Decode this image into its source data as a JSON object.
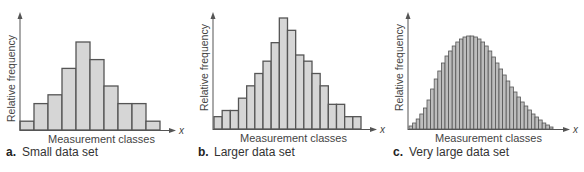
{
  "chart_data": [
    {
      "type": "bar",
      "panel": "a",
      "caption_letter": "a.",
      "caption": "Small data set",
      "xlabel": "Measurement classes",
      "ylabel": "Relative frequency",
      "x_variable": "x",
      "categories": [
        "1",
        "2",
        "3",
        "4",
        "5",
        "6",
        "7",
        "8",
        "9",
        "10"
      ],
      "values": [
        1,
        3,
        4,
        7,
        10,
        8,
        5,
        3,
        3,
        1
      ],
      "ylim": [
        0,
        10.5
      ],
      "grid": false
    },
    {
      "type": "bar",
      "panel": "b",
      "caption_letter": "b.",
      "caption": "Larger data set",
      "xlabel": "Measurement classes",
      "ylabel": "Relative frequency",
      "x_variable": "x",
      "categories": [
        "1",
        "2",
        "3",
        "4",
        "5",
        "6",
        "7",
        "8",
        "9",
        "10",
        "11",
        "12",
        "13",
        "14",
        "15",
        "16",
        "17",
        "18"
      ],
      "values": [
        1,
        1.5,
        1.5,
        2.5,
        3.5,
        4.5,
        5.5,
        7,
        9,
        8,
        6,
        5.5,
        4.5,
        3.5,
        2,
        2,
        1,
        1
      ],
      "ylim": [
        0,
        10
      ],
      "grid": false
    },
    {
      "type": "bar",
      "panel": "c",
      "caption_letter": "c.",
      "caption": "Very large data set",
      "xlabel": "Measurement classes",
      "ylabel": "Relative frequency",
      "x_variable": "x",
      "categories": [
        "1",
        "2",
        "3",
        "4",
        "5",
        "6",
        "7",
        "8",
        "9",
        "10",
        "11",
        "12",
        "13",
        "14",
        "15",
        "16",
        "17",
        "18",
        "19",
        "20",
        "21",
        "22",
        "23",
        "24",
        "25",
        "26",
        "27",
        "28",
        "29",
        "30",
        "31",
        "32",
        "33",
        "34",
        "35",
        "36",
        "37",
        "38",
        "39",
        "40"
      ],
      "values": [
        0.3,
        0.6,
        1.0,
        1.5,
        2.1,
        2.9,
        4.0,
        5.0,
        5.8,
        6.6,
        7.3,
        7.8,
        8.3,
        8.7,
        9.0,
        9.2,
        9.3,
        9.3,
        9.2,
        9.0,
        8.7,
        8.3,
        7.8,
        7.2,
        6.6,
        6.0,
        5.4,
        4.8,
        4.2,
        3.7,
        3.2,
        2.7,
        2.3,
        1.9,
        1.5,
        1.2,
        0.9,
        0.6,
        0.4,
        0.2
      ],
      "ylim": [
        0,
        10
      ],
      "grid": false
    }
  ]
}
